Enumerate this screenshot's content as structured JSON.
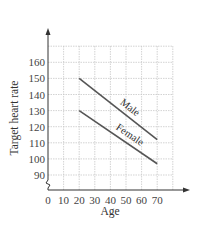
{
  "chart_data": {
    "type": "line",
    "title": "",
    "xlabel": "Age",
    "ylabel": "Target heart rate",
    "xlim": [
      0,
      80
    ],
    "ylim": [
      85,
      170
    ],
    "x_ticks": [
      0,
      10,
      20,
      30,
      40,
      50,
      60,
      70
    ],
    "y_ticks": [
      90,
      100,
      110,
      120,
      130,
      140,
      150,
      160
    ],
    "grid": true,
    "axis_break_on_y": true,
    "legend": "inline labels",
    "series": [
      {
        "name": "Male",
        "x": [
          20,
          70
        ],
        "y": [
          150,
          112
        ],
        "color": "#555555"
      },
      {
        "name": "Female",
        "x": [
          20,
          70
        ],
        "y": [
          130,
          97
        ],
        "color": "#555555"
      }
    ]
  },
  "colors": {
    "grid": "#c8c8c8",
    "axis": "#333333",
    "line": "#555555"
  }
}
